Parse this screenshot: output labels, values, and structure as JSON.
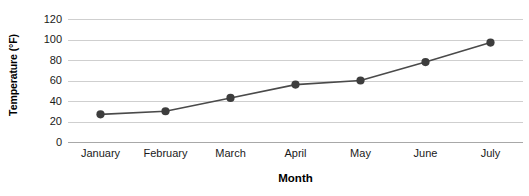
{
  "chart_data": {
    "type": "line",
    "title": "",
    "subtitle": "",
    "xlabel": "Month",
    "ylabel": "Temperature (°F)",
    "categories": [
      "January",
      "February",
      "March",
      "April",
      "May",
      "June",
      "July"
    ],
    "values": [
      27,
      30,
      43,
      56,
      60,
      78,
      97
    ],
    "series": [
      {
        "name": "Temperature",
        "values": [
          27,
          30,
          43,
          56,
          60,
          78,
          97
        ]
      }
    ],
    "ylim": [
      0,
      120
    ],
    "ytick_labels": [
      "0",
      "20",
      "40",
      "60",
      "80",
      "100",
      "120"
    ],
    "ytick_values": [
      0,
      20,
      40,
      60,
      80,
      100,
      120
    ],
    "grid": "horizontal",
    "legend": "none",
    "marker": "filled-circle",
    "colors": {
      "line": "#4a4a4a",
      "marker": "#3d3d3d",
      "gridline": "#cfcfcf",
      "axis": "#a8a8a8",
      "text": "#1a1a1a",
      "background": "#ffffff"
    }
  }
}
